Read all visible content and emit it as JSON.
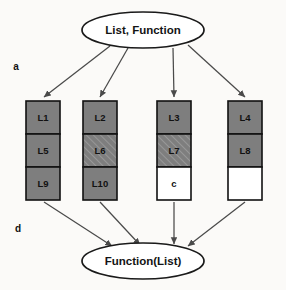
{
  "diagram": {
    "title_top": "List, Function",
    "title_bottom": "Function(List)",
    "side_labels": [
      {
        "text": "a",
        "x": 16,
        "y": 67
      },
      {
        "text": "d",
        "x": 18,
        "y": 229
      }
    ],
    "colors": {
      "solid_fill": "#7e7e7e",
      "empty_fill": "#ffffff",
      "stroke": "#111111",
      "edge": "#4a4a4a",
      "background": "#fbfaf8"
    },
    "top_node": {
      "cx": 143,
      "cy": 30,
      "rx": 61,
      "ry": 18
    },
    "bottom_node": {
      "cx": 143,
      "cy": 261,
      "rx": 61,
      "ry": 18
    },
    "columns": [
      {
        "name": "column-1",
        "x": 26,
        "width": 34,
        "cells": [
          {
            "label": "L1",
            "fill": "solid"
          },
          {
            "label": "L5",
            "fill": "solid"
          },
          {
            "label": "L9",
            "fill": "solid"
          }
        ]
      },
      {
        "name": "column-2",
        "x": 83,
        "width": 34,
        "cells": [
          {
            "label": "L2",
            "fill": "solid"
          },
          {
            "label": "L6",
            "fill": "hatched"
          },
          {
            "label": "L10",
            "fill": "solid"
          }
        ]
      },
      {
        "name": "column-3",
        "x": 157,
        "width": 34,
        "cells": [
          {
            "label": "L3",
            "fill": "solid"
          },
          {
            "label": "L7",
            "fill": "hatched"
          },
          {
            "label": "c",
            "fill": "empty"
          }
        ]
      },
      {
        "name": "column-4",
        "x": 228,
        "width": 34,
        "cells": [
          {
            "label": "L4",
            "fill": "solid"
          },
          {
            "label": "L8",
            "fill": "solid"
          },
          {
            "label": "",
            "fill": "empty"
          }
        ]
      }
    ],
    "cell_geometry": {
      "top": 101,
      "cell_height": 33
    },
    "edges_down": [
      {
        "name": "edge-top-to-column-1",
        "x1": 110,
        "y1": 46,
        "x2": 44,
        "y2": 99
      },
      {
        "name": "edge-top-to-column-2",
        "x1": 128,
        "y1": 48,
        "x2": 100,
        "y2": 99
      },
      {
        "name": "edge-top-to-column-3",
        "x1": 173,
        "y1": 48,
        "x2": 174,
        "y2": 99
      },
      {
        "name": "edge-top-to-column-4",
        "x1": 188,
        "y1": 45,
        "x2": 245,
        "y2": 99
      }
    ],
    "edges_up": [
      {
        "name": "edge-column-1-to-bottom",
        "x1": 44,
        "y1": 202,
        "x2": 110,
        "y2": 245
      },
      {
        "name": "edge-column-2-to-bottom",
        "x1": 100,
        "y1": 202,
        "x2": 138,
        "y2": 244
      },
      {
        "name": "edge-column-3-to-bottom",
        "x1": 174,
        "y1": 202,
        "x2": 174,
        "y2": 244
      },
      {
        "name": "edge-column-4-to-bottom",
        "x1": 245,
        "y1": 202,
        "x2": 190,
        "y2": 245
      }
    ]
  }
}
